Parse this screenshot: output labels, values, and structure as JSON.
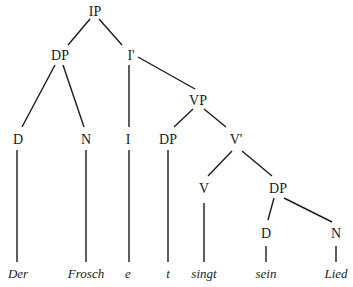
{
  "diagram": {
    "type": "syntax-tree",
    "colors": {
      "ink": "#1a1a1a",
      "background": "#ffffff"
    },
    "nodes": {
      "ip": {
        "label": "IP",
        "x": 95,
        "y": 15
      },
      "dp_subj": {
        "label": "DP",
        "x": 60,
        "y": 60
      },
      "ibar": {
        "label": "I'",
        "x": 131,
        "y": 60
      },
      "vp": {
        "label": "VP",
        "x": 198,
        "y": 105
      },
      "d_subj": {
        "label": "D",
        "x": 18,
        "y": 143
      },
      "n_subj": {
        "label": "N",
        "x": 86,
        "y": 143
      },
      "i": {
        "label": "I",
        "x": 128,
        "y": 143
      },
      "dp_trace": {
        "label": "DP",
        "x": 168,
        "y": 143
      },
      "vbar": {
        "label": "V'",
        "x": 236,
        "y": 143
      },
      "v": {
        "label": "V",
        "x": 204,
        "y": 192
      },
      "dp_obj": {
        "label": "DP",
        "x": 278,
        "y": 192
      },
      "d_obj": {
        "label": "D",
        "x": 266,
        "y": 237
      },
      "n_obj": {
        "label": "N",
        "x": 336,
        "y": 237
      }
    },
    "leaves": [
      {
        "text": "Der",
        "x": 18
      },
      {
        "text": "Frosch",
        "x": 86
      },
      {
        "text": "e",
        "x": 128
      },
      {
        "text": "t",
        "x": 168
      },
      {
        "text": "singt",
        "x": 204
      },
      {
        "text": "sein",
        "x": 266
      },
      {
        "text": "Lied",
        "x": 336
      }
    ],
    "leaf_y": 278
  }
}
